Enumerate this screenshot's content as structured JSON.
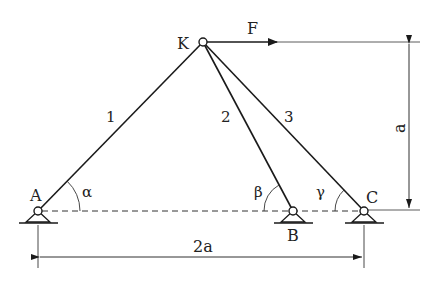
{
  "diagram": {
    "nodes": {
      "K": {
        "label": "K",
        "x": 203,
        "y": 42
      },
      "A": {
        "label": "A",
        "x": 38,
        "y": 211
      },
      "B": {
        "label": "B",
        "x": 293,
        "y": 211
      },
      "C": {
        "label": "C",
        "x": 364,
        "y": 211
      }
    },
    "members": [
      {
        "id": "1",
        "label": "1",
        "from": "A",
        "to": "K"
      },
      {
        "id": "2",
        "label": "2",
        "from": "B",
        "to": "K"
      },
      {
        "id": "3",
        "label": "3",
        "from": "C",
        "to": "K"
      }
    ],
    "force": {
      "label": "F",
      "direction": "right"
    },
    "angles": {
      "alpha": "α",
      "beta": "β",
      "gamma": "γ"
    },
    "dimensions": {
      "height": "a",
      "width": "2a"
    },
    "colors": {
      "stroke": "#1a1a1a",
      "dash": "#333333",
      "background": "#ffffff"
    }
  }
}
